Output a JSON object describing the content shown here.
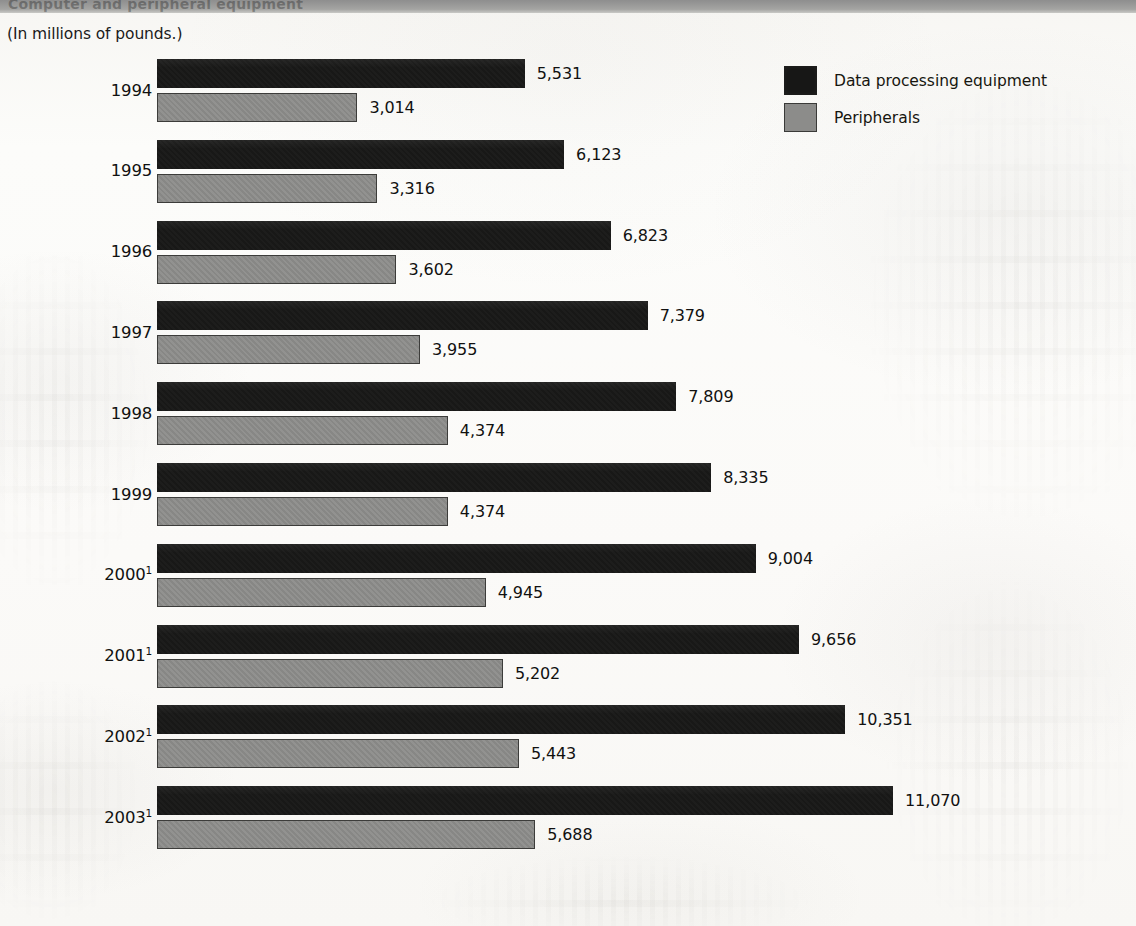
{
  "title_band": {
    "text": "Computer and peripheral equipment"
  },
  "units_caption": "(In millions of pounds.)",
  "legend": {
    "items": [
      {
        "label": "Data processing equipment",
        "swatch": "dark-swatch-icon",
        "color": "#181817"
      },
      {
        "label": "Peripherals",
        "swatch": "gray-swatch-icon",
        "color": "#8c8c8a"
      }
    ]
  },
  "chart_data": {
    "type": "bar",
    "orientation": "horizontal",
    "title": "Computer and peripheral equipment",
    "subtitle": "(In millions of pounds.)",
    "xlabel": "",
    "ylabel": "",
    "grid": false,
    "legend_position": "top-right",
    "xlim": [
      0,
      11070
    ],
    "categories": [
      "1994",
      "1995",
      "1996",
      "1997",
      "1998",
      "1999",
      "2000",
      "2001",
      "2002",
      "2003"
    ],
    "category_labels": [
      "1994",
      "1995",
      "1996",
      "1997",
      "1998",
      "1999",
      "2000¹",
      "2001¹",
      "2002¹",
      "2003¹"
    ],
    "footnote_marker_years": [
      "2000",
      "2001",
      "2002",
      "2003"
    ],
    "series": [
      {
        "name": "Data processing equipment",
        "color": "#181817",
        "values": [
          5531,
          6123,
          6823,
          7379,
          7809,
          8335,
          9004,
          9656,
          10351,
          11070
        ],
        "labels": [
          "5,531",
          "6,123",
          "6,823",
          "7,379",
          "7,809",
          "8,335",
          "9,004",
          "9,656",
          "10,351",
          "11,070"
        ]
      },
      {
        "name": "Peripherals",
        "color": "#8c8c8a",
        "values": [
          3014,
          3316,
          3602,
          3955,
          4374,
          4374,
          4945,
          5202,
          5443,
          5688
        ],
        "labels": [
          "3,014",
          "3,316",
          "3,602",
          "3,955",
          "4,374",
          "4,374",
          "4,945",
          "5,202",
          "5,443",
          "5,688"
        ]
      }
    ]
  },
  "rows": [
    {
      "year": "1994",
      "sup": "",
      "dark_label": "5,531",
      "gray_label": "3,014",
      "dark_value": 5531,
      "gray_value": 3014
    },
    {
      "year": "1995",
      "sup": "",
      "dark_label": "6,123",
      "gray_label": "3,316",
      "dark_value": 6123,
      "gray_value": 3316
    },
    {
      "year": "1996",
      "sup": "",
      "dark_label": "6,823",
      "gray_label": "3,602",
      "dark_value": 6823,
      "gray_value": 3602
    },
    {
      "year": "1997",
      "sup": "",
      "dark_label": "7,379",
      "gray_label": "3,955",
      "dark_value": 7379,
      "gray_value": 3955
    },
    {
      "year": "1998",
      "sup": "",
      "dark_label": "7,809",
      "gray_label": "4,374",
      "dark_value": 7809,
      "gray_value": 4374
    },
    {
      "year": "1999",
      "sup": "",
      "dark_label": "8,335",
      "gray_label": "4,374",
      "dark_value": 8335,
      "gray_value": 4374
    },
    {
      "year": "2000",
      "sup": "1",
      "dark_label": "9,004",
      "gray_label": "4,945",
      "dark_value": 9004,
      "gray_value": 4945
    },
    {
      "year": "2001",
      "sup": "1",
      "dark_label": "9,656",
      "gray_label": "5,202",
      "dark_value": 9656,
      "gray_value": 5202
    },
    {
      "year": "2002",
      "sup": "1",
      "dark_label": "10,351",
      "gray_label": "5,443",
      "dark_value": 10351,
      "gray_value": 5443
    },
    {
      "year": "2003",
      "sup": "1",
      "dark_label": "11,070",
      "gray_label": "5,688",
      "dark_value": 11070,
      "gray_value": 5688
    }
  ],
  "layout": {
    "bar_origin_x": 157,
    "px_per_unit": 0.06649,
    "first_group_top": 59,
    "group_pitch": 80.8,
    "bar_height": 29,
    "bar_gap": 5
  }
}
